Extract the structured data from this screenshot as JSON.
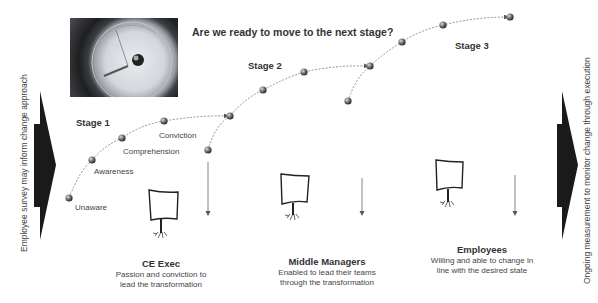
{
  "title": "Are we ready to move to the next stage?",
  "photo": {
    "alt": "barometer-gauge"
  },
  "left_arrow": {
    "label": "Employee survey may inform change approach",
    "color": "#1a1a1a"
  },
  "right_arrow": {
    "label": "Ongoing measurement to monitor change through execution",
    "color": "#1a1a1a"
  },
  "stages": [
    {
      "label": "Stage 1"
    },
    {
      "label": "Stage 2"
    },
    {
      "label": "Stage 3"
    }
  ],
  "steps": [
    {
      "label": "Unaware"
    },
    {
      "label": "Awareness"
    },
    {
      "label": "Comprehension"
    },
    {
      "label": "Conviction"
    }
  ],
  "groups": [
    {
      "heading": "CE Exec",
      "line1": "Passion and conviction to",
      "line2": "lead the transformation"
    },
    {
      "heading": "Middle Managers",
      "line1": "Enabled to lead their teams",
      "line2": "through the transformation"
    },
    {
      "heading": "Employees",
      "line1": "Willing and able to change in",
      "line2": "line with the desired state"
    }
  ],
  "colors": {
    "dot": "#555555",
    "line": "#777777",
    "text": "#333333"
  }
}
